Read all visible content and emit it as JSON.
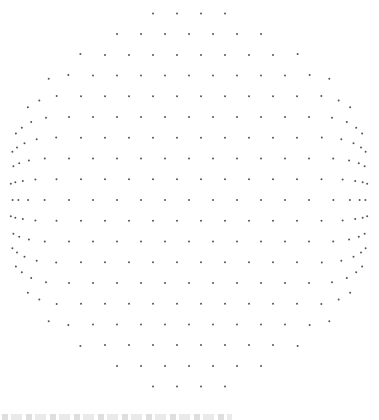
{
  "figure": {
    "center": [
      189,
      200
    ],
    "radius": 185,
    "lattice_spacing": 24,
    "dot_color": "#555555",
    "dot_size": 1.6,
    "background": "#ffffff"
  },
  "caption": {
    "text": ""
  }
}
